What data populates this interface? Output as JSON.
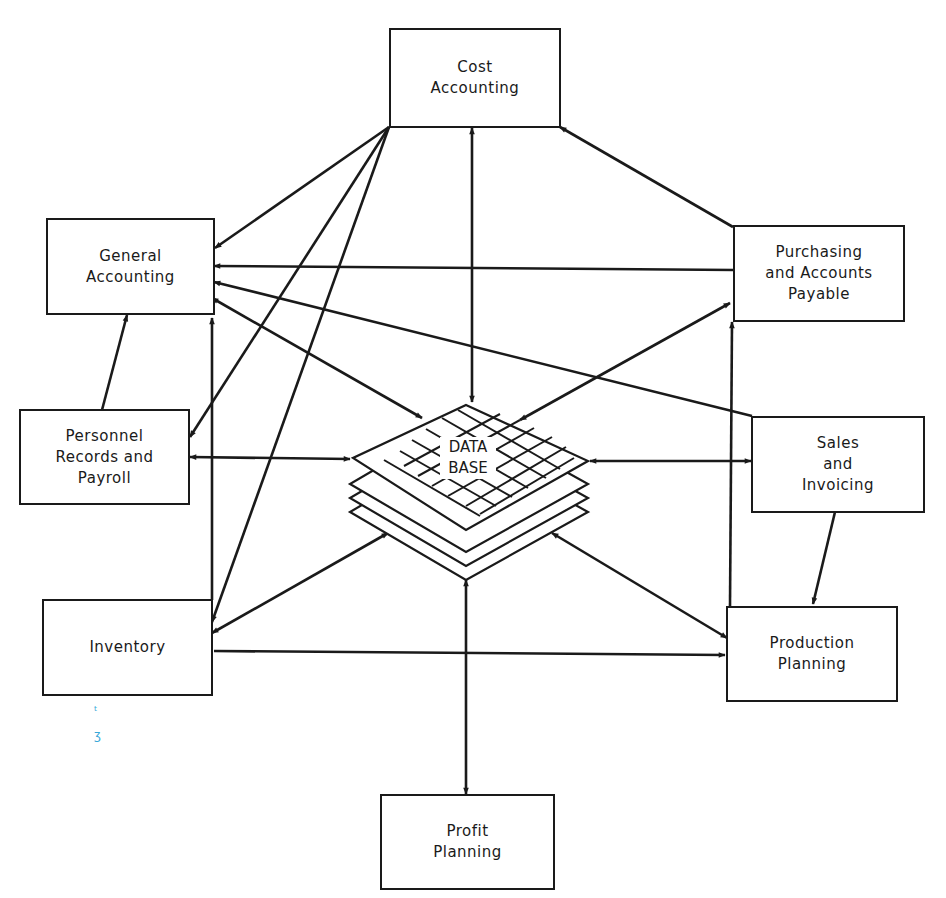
{
  "diagram": {
    "type": "data-flow",
    "center": {
      "label": "DATA\nBASE",
      "icon": "stacked-grid-database-icon"
    },
    "nodes": [
      {
        "id": "cost_accounting",
        "label": "Cost\nAccounting"
      },
      {
        "id": "general_accounting",
        "label": "General\nAccounting"
      },
      {
        "id": "purchasing",
        "label": "Purchasing\nand Accounts\nPayable"
      },
      {
        "id": "personnel",
        "label": "Personnel\nRecords and\nPayroll"
      },
      {
        "id": "sales",
        "label": "Sales\nand\nInvoicing"
      },
      {
        "id": "inventory",
        "label": "Inventory"
      },
      {
        "id": "production",
        "label": "Production\nPlanning"
      },
      {
        "id": "profit",
        "label": "Profit\nPlanning"
      }
    ],
    "edges": [
      {
        "from": "cost_accounting",
        "to": "database",
        "bidirectional": true
      },
      {
        "from": "general_accounting",
        "to": "database",
        "bidirectional": true
      },
      {
        "from": "purchasing",
        "to": "database",
        "bidirectional": true
      },
      {
        "from": "personnel",
        "to": "database",
        "bidirectional": true
      },
      {
        "from": "sales",
        "to": "database",
        "bidirectional": true
      },
      {
        "from": "inventory",
        "to": "database",
        "bidirectional": true
      },
      {
        "from": "production",
        "to": "database",
        "bidirectional": true
      },
      {
        "from": "profit",
        "to": "database",
        "bidirectional": true
      },
      {
        "from": "cost_accounting",
        "to": "general_accounting",
        "bidirectional": false
      },
      {
        "from": "cost_accounting",
        "to": "personnel",
        "bidirectional": false
      },
      {
        "from": "cost_accounting",
        "to": "inventory",
        "bidirectional": false
      },
      {
        "from": "purchasing",
        "to": "cost_accounting",
        "bidirectional": false
      },
      {
        "from": "purchasing",
        "to": "general_accounting",
        "bidirectional": false
      },
      {
        "from": "sales",
        "to": "general_accounting",
        "bidirectional": false
      },
      {
        "from": "personnel",
        "to": "general_accounting",
        "bidirectional": false
      },
      {
        "from": "inventory",
        "to": "general_accounting",
        "bidirectional": false
      },
      {
        "from": "inventory",
        "to": "production",
        "bidirectional": false
      },
      {
        "from": "production",
        "to": "purchasing",
        "bidirectional": false
      },
      {
        "from": "sales",
        "to": "production",
        "bidirectional": false
      }
    ],
    "colors": {
      "ink": "#1a1a1a",
      "paper": "#ffffff",
      "pen_mark": "#3aa8d8"
    },
    "marks": [
      "ᵗ",
      "ʒ"
    ]
  }
}
